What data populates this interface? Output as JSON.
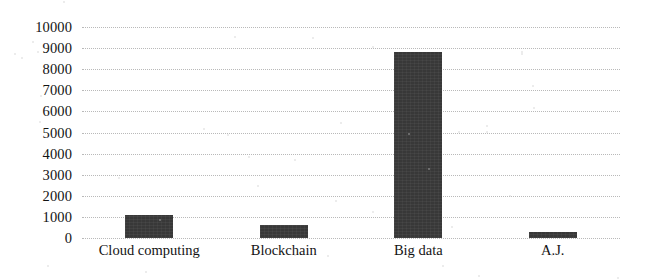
{
  "chart_data": {
    "type": "bar",
    "title": "",
    "subtitle": "",
    "xlabel": "",
    "ylabel": "",
    "categories": [
      "Cloud computing",
      "Blockchain",
      "Big data",
      "A.J."
    ],
    "values": [
      1100,
      600,
      8800,
      280
    ],
    "series": [
      {
        "name": "",
        "values": [
          1100,
          600,
          8800,
          280
        ]
      }
    ],
    "ylim": [
      0,
      10000
    ],
    "ytick_labels": [
      "10000",
      "9000",
      "8000",
      "7000",
      "6000",
      "5000",
      "4000",
      "3000",
      "2000",
      "1000",
      "0"
    ],
    "ytick_values": [
      10000,
      9000,
      8000,
      7000,
      6000,
      5000,
      4000,
      3000,
      2000,
      1000,
      0
    ],
    "ytick_step": 1000,
    "grid": true,
    "grid_orientation": "horizontal",
    "grid_style": "dotted",
    "legend": false,
    "legend_position": "none",
    "annotations": [],
    "bar_color": "#383838",
    "grid_color": "#b9b9b9",
    "background_color": "#ffffff",
    "text_color": "#131313"
  },
  "figure": {
    "name": "bar-chart"
  }
}
